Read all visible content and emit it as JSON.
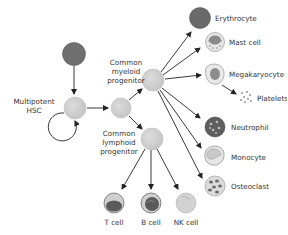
{
  "colors": {
    "background": "#ffffff",
    "progenitor_fill": "#cfcfcf",
    "progenitor_stroke": "#bdbdbd",
    "dark_cell": "#6f6f6f",
    "erythrocyte": "#6a6a6a",
    "arrow": "#222222",
    "text": "#333333"
  },
  "nodes": {
    "source": {
      "label": ""
    },
    "hsc": {
      "label_line1": "Multipotent",
      "label_line2": "HSC"
    },
    "intermediate": {
      "label": ""
    },
    "cmp": {
      "label_line1": "Common",
      "label_line2": "myeloid",
      "label_line3": "progenitor"
    },
    "clp": {
      "label_line1": "Common",
      "label_line2": "lymphoid",
      "label_line3": "progenitor"
    }
  },
  "myeloid_outputs": [
    {
      "id": "erythrocyte",
      "label": "Erythrocyte"
    },
    {
      "id": "mast-cell",
      "label": "Mast cell"
    },
    {
      "id": "megakaryocyte",
      "label": "Megakaryocyte"
    },
    {
      "id": "platelets",
      "label": "Platelets"
    },
    {
      "id": "neutrophil",
      "label": "Neutrophil"
    },
    {
      "id": "monocyte",
      "label": "Monocyte"
    },
    {
      "id": "osteoclast",
      "label": "Osteoclast"
    }
  ],
  "lymphoid_outputs": [
    {
      "id": "t-cell",
      "label": "T cell"
    },
    {
      "id": "b-cell",
      "label": "B cell"
    },
    {
      "id": "nk-cell",
      "label": "NK cell"
    }
  ],
  "edges": [
    "source -> hsc",
    "hsc -> hsc (self-renewal)",
    "hsc -> intermediate",
    "intermediate -> cmp",
    "intermediate -> clp",
    "cmp -> erythrocyte",
    "cmp -> mast-cell",
    "cmp -> megakaryocyte",
    "megakaryocyte -> platelets",
    "cmp -> neutrophil",
    "cmp -> monocyte",
    "cmp -> osteoclast",
    "clp -> t-cell",
    "clp -> b-cell",
    "clp -> nk-cell"
  ]
}
